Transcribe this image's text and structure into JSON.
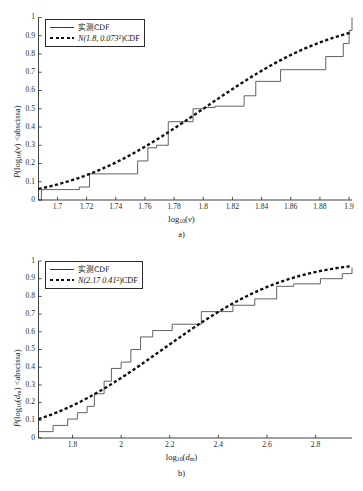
{
  "figure": {
    "panels": [
      {
        "id": "a",
        "caption": "a)",
        "xlabel_main": "log",
        "xlabel_sub": "10",
        "xlabel_arg": "(v)",
        "ylabel_main": "P(log",
        "ylabel_sub": "10",
        "ylabel_arg": "(v) <abscissa)",
        "legend": {
          "empirical": "实测CDF",
          "normal_prefix": "N(1.8, 0.073",
          "normal_exp": "2",
          "normal_suffix": ")CDF"
        },
        "chart_data": {
          "type": "line",
          "title": "",
          "xlabel": "log10(v)",
          "ylabel": "P(log10(v) < abscissa)",
          "xlim": [
            1.687,
            1.902
          ],
          "ylim": [
            0,
            1
          ],
          "xticks": [
            1.7,
            1.72,
            1.74,
            1.76,
            1.78,
            1.8,
            1.82,
            1.84,
            1.86,
            1.88,
            1.9
          ],
          "xtick_labels": [
            "1.7",
            "1.72",
            "1.74",
            "1.76",
            "1.78",
            "1.8",
            "1.82",
            "1.84",
            "1.86",
            "1.88",
            "1.9"
          ],
          "yticks": [
            0,
            0.1,
            0.2,
            0.3,
            0.4,
            0.5,
            0.6,
            0.7,
            0.8,
            0.9,
            1
          ],
          "ytick_labels": [
            "0",
            "0.1",
            "0.2",
            "0.3",
            "0.4",
            "0.5",
            "0.6",
            "0.7",
            "0.8",
            "0.9",
            "1"
          ],
          "grid": false,
          "legend_position": "upper-left",
          "series": [
            {
              "name": "实测CDF",
              "style": "step-solid",
              "x": [
                1.687,
                1.689,
                1.715,
                1.722,
                1.755,
                1.762,
                1.768,
                1.776,
                1.793,
                1.801,
                1.808,
                1.828,
                1.836,
                1.853,
                1.884,
                1.896,
                1.9,
                1.902
              ],
              "y": [
                0.0,
                0.057,
                0.071,
                0.143,
                0.214,
                0.286,
                0.3,
                0.429,
                0.5,
                0.507,
                0.514,
                0.571,
                0.65,
                0.714,
                0.786,
                0.857,
                0.929,
                1.0
              ]
            },
            {
              "name": "N(1.8, 0.073^2)CDF",
              "style": "dotted",
              "mu": 1.8,
              "sigma": 0.073,
              "x": [
                1.687,
                1.7,
                1.72,
                1.74,
                1.76,
                1.78,
                1.8,
                1.82,
                1.84,
                1.86,
                1.88,
                1.9,
                1.902
              ],
              "y": [
                0.062,
                0.085,
                0.138,
                0.207,
                0.292,
                0.391,
                0.5,
                0.609,
                0.708,
                0.793,
                0.862,
                0.915,
                0.919
              ]
            }
          ]
        }
      },
      {
        "id": "b",
        "caption": "b)",
        "xlabel_main": "log",
        "xlabel_sub": "10",
        "xlabel_arg_pre": "(",
        "xlabel_arg_var": "d",
        "xlabel_arg_sub": "m",
        "xlabel_arg_post": ")",
        "ylabel_main": "P(log",
        "ylabel_sub": "10",
        "ylabel_arg": "(dm) <abscissa)",
        "legend": {
          "empirical": "实测CDF",
          "normal_prefix": "N(2.17 0.41",
          "normal_exp": "2",
          "normal_suffix": ")CDF"
        },
        "chart_data": {
          "type": "line",
          "title": "",
          "xlabel": "log10(dm)",
          "ylabel": "P(log10(dm) < abscissa)",
          "xlim": [
            1.66,
            2.95
          ],
          "ylim": [
            0,
            1
          ],
          "xticks": [
            1.8,
            2.0,
            2.2,
            2.4,
            2.6,
            2.8
          ],
          "xtick_labels": [
            "1.8",
            "2",
            "2.2",
            "2.4",
            "2.6",
            "2.8"
          ],
          "yticks": [
            0,
            0.1,
            0.2,
            0.3,
            0.4,
            0.5,
            0.6,
            0.7,
            0.8,
            0.9,
            1
          ],
          "ytick_labels": [
            "0",
            "0.1",
            "0.2",
            "0.3",
            "0.4",
            "0.5",
            "0.6",
            "0.7",
            "0.8",
            "0.9",
            "1"
          ],
          "grid": false,
          "legend_position": "upper-left",
          "series": [
            {
              "name": "实测CDF",
              "style": "step-solid",
              "x": [
                1.66,
                1.72,
                1.78,
                1.82,
                1.86,
                1.89,
                1.93,
                1.96,
                2.0,
                2.04,
                2.08,
                2.13,
                2.21,
                2.33,
                2.4,
                2.46,
                2.55,
                2.64,
                2.71,
                2.82,
                2.91,
                2.95
              ],
              "y": [
                0.036,
                0.071,
                0.107,
                0.143,
                0.179,
                0.25,
                0.321,
                0.393,
                0.429,
                0.5,
                0.571,
                0.607,
                0.643,
                0.714,
                0.714,
                0.75,
                0.786,
                0.857,
                0.871,
                0.9,
                0.929,
                0.964
              ]
            },
            {
              "name": "N(2.17 0.41^2)CDF",
              "style": "dotted",
              "mu": 2.17,
              "sigma": 0.41,
              "x": [
                1.66,
                1.8,
                1.9,
                2.0,
                2.1,
                2.2,
                2.3,
                2.4,
                2.5,
                2.6,
                2.7,
                2.8,
                2.9,
                2.95
              ],
              "y": [
                0.105,
                0.186,
                0.257,
                0.339,
                0.433,
                0.529,
                0.624,
                0.712,
                0.787,
                0.849,
                0.896,
                0.931,
                0.955,
                0.964
              ]
            }
          ]
        }
      }
    ]
  }
}
